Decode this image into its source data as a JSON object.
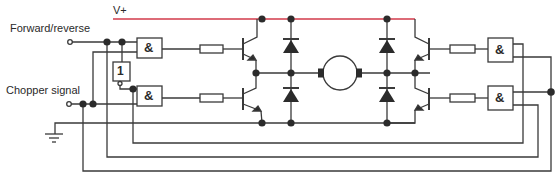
{
  "diagram": {
    "labels": {
      "supply": "V+",
      "forward_reverse": "Forward/reverse",
      "chopper": "Chopper signal",
      "and_gate": "&",
      "not_gate": "1"
    },
    "colors": {
      "wire": "#3a3a3a",
      "supply_line": "#d23a4a",
      "component_fill": "#2b2b2b",
      "background": "#ffffff"
    },
    "components": [
      {
        "type": "input-terminal",
        "name": "Forward/reverse"
      },
      {
        "type": "input-terminal",
        "name": "Chopper signal"
      },
      {
        "type": "not-gate",
        "label": "1"
      },
      {
        "type": "and-gate",
        "label": "&",
        "count": 4
      },
      {
        "type": "resistor",
        "count": 4
      },
      {
        "type": "transistor",
        "count": 4
      },
      {
        "type": "diode",
        "count": 4
      },
      {
        "type": "motor",
        "count": 1
      },
      {
        "type": "ground",
        "count": 1
      }
    ]
  }
}
